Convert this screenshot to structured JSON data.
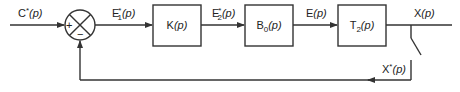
{
  "diagram": {
    "type": "block-diagram",
    "input": {
      "label": "C*(p)",
      "base": "C",
      "sup": "*",
      "arg": "(p)"
    },
    "summing_junction": {
      "plus_sign": "+",
      "minus_sign": "−"
    },
    "signals": {
      "e1": {
        "label": "E1*(p)",
        "base": "E",
        "sub": "1",
        "sup": "*",
        "arg": "(p)"
      },
      "e2": {
        "label": "E2*(p)",
        "base": "E",
        "sub": "2",
        "sup": "*",
        "arg": "(p)"
      },
      "e": {
        "label": "E(p)",
        "base": "E",
        "arg": "(p)"
      },
      "x": {
        "label": "X(p)",
        "base": "X",
        "arg": "(p)"
      },
      "xs": {
        "label": "X*(p)",
        "base": "X",
        "sup": "*",
        "arg": "(p)"
      }
    },
    "blocks": [
      {
        "id": "k",
        "label": "K(p)",
        "base": "K",
        "sub": "",
        "arg": "(p)"
      },
      {
        "id": "b0",
        "label": "B0(p)",
        "base": "B",
        "sub": "0",
        "arg": "(p)"
      },
      {
        "id": "t2",
        "label": "T2(p)",
        "base": "T",
        "sub": "2",
        "arg": "(p)"
      }
    ],
    "edges": [
      {
        "from": "input",
        "to": "summing_junction",
        "label": "C*(p)"
      },
      {
        "from": "summing_junction",
        "to": "k",
        "label": "E1*(p)"
      },
      {
        "from": "k",
        "to": "b0",
        "label": "E2*(p)"
      },
      {
        "from": "b0",
        "to": "t2",
        "label": "E(p)"
      },
      {
        "from": "t2",
        "to": "output",
        "label": "X(p)"
      },
      {
        "from": "sampler",
        "to": "summing_junction",
        "label": "X*(p)",
        "sign": "-"
      }
    ],
    "colors": {
      "stroke": "#333333",
      "text": "#222222",
      "background": "#ffffff"
    }
  }
}
